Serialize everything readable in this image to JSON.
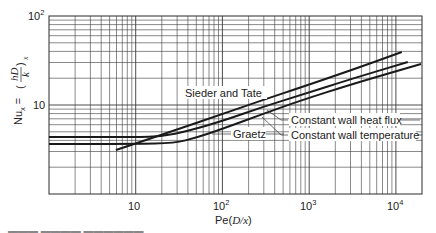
{
  "chart_data": {
    "type": "line",
    "scale": {
      "x": "log",
      "y": "log"
    },
    "xlim": [
      1,
      20000
    ],
    "ylim": [
      1,
      100
    ],
    "grid": true,
    "xlabel": "Pe(D/x)",
    "ylabel": "Nu_x = (hD/k)_x",
    "x_ticks": [
      {
        "value": 10,
        "label": "10"
      },
      {
        "value": 100,
        "label": "10",
        "sup": "2"
      },
      {
        "value": 1000,
        "label": "10",
        "sup": "3"
      },
      {
        "value": 10000,
        "label": "10",
        "sup": "4"
      }
    ],
    "y_ticks": [
      {
        "value": 10,
        "label": "10"
      },
      {
        "value": 100,
        "label": "10",
        "sup": "2"
      }
    ],
    "series": [
      {
        "name": "Sieder and Tate",
        "points": [
          [
            5.9,
            3.12
          ],
          [
            10,
            3.7
          ],
          [
            30,
            5.3
          ],
          [
            100,
            7.9
          ],
          [
            300,
            11.5
          ],
          [
            790,
            15.7
          ],
          [
            3000,
            24.5
          ],
          [
            11700,
            39.4
          ]
        ]
      },
      {
        "name": "Constant wall heat flux",
        "points": [
          [
            1,
            4.36
          ],
          [
            10,
            4.36
          ],
          [
            20,
            4.45
          ],
          [
            40,
            5.1
          ],
          [
            100,
            6.6
          ],
          [
            300,
            9.6
          ],
          [
            790,
            12.9
          ],
          [
            3000,
            19.5
          ],
          [
            13700,
            30.4
          ]
        ]
      },
      {
        "name": "Constant wall temperature",
        "points": [
          [
            1,
            3.66
          ],
          [
            10,
            3.66
          ],
          [
            28,
            3.72
          ],
          [
            50,
            4.3
          ],
          [
            100,
            5.4
          ],
          [
            300,
            8.0
          ],
          [
            790,
            11.2
          ],
          [
            3000,
            17.0
          ],
          [
            19500,
            28.9
          ]
        ]
      }
    ],
    "annotations": [
      {
        "text": "Sieder and Tate",
        "x_px": 185,
        "y_px": 97
      },
      {
        "text": "Graetz",
        "x_px": 233,
        "y_px": 138
      },
      {
        "text": "Constant wall heat flux",
        "x_px": 290,
        "y_px": 123
      },
      {
        "text": "Constant wall temperature",
        "x_px": 290,
        "y_px": 138
      }
    ]
  },
  "labels": {
    "sieder": "Sieder and Tate",
    "graetz": "Graetz",
    "heat_flux": "Constant wall heat flux",
    "wall_temp": "Constant wall temperature",
    "x_tick_10": "10",
    "x_tick_100_base": "10",
    "x_tick_100_exp": "2",
    "x_tick_1000_base": "10",
    "x_tick_1000_exp": "3",
    "x_tick_10000_base": "10",
    "x_tick_10000_exp": "4",
    "y_tick_10": "10",
    "y_tick_100_base": "10",
    "y_tick_100_exp": "2",
    "xlabel_main": "Pe",
    "xlabel_paren_open": "(",
    "xlabel_var": "D/x",
    "xlabel_paren_close": ")",
    "ylabel_nu": "Nu",
    "ylabel_sub": "x",
    "ylabel_eq": " = ",
    "ylabel_frac_num": "hD",
    "ylabel_frac_den": "k",
    "ylabel_sub2": "x"
  },
  "colors": {
    "line": "#1a1a1a",
    "grid": "#3a3a3a",
    "background": "#ffffff"
  }
}
